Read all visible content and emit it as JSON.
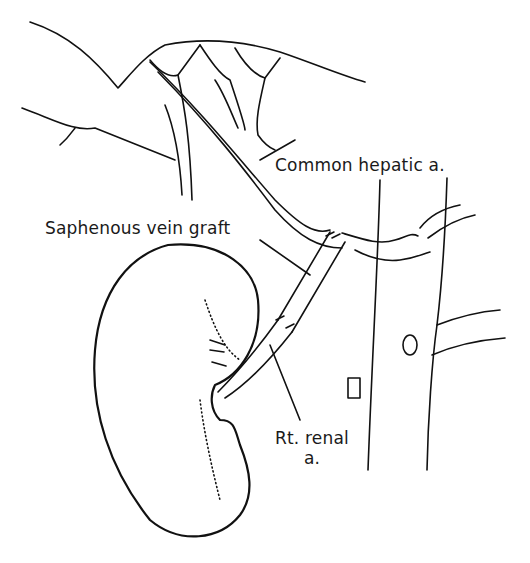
{
  "figure": {
    "type": "anatomical illustration",
    "background": "#ffffff",
    "line_color": "#111111"
  },
  "labels": {
    "common_hepatic": "Common hepatic a.",
    "saphenous_graft": "Saphenous vein graft",
    "renal_line1": "Rt. renal",
    "renal_line2": "a."
  },
  "structures": [
    "liver",
    "hepatic artery branches",
    "common hepatic artery",
    "saphenous vein graft",
    "right kidney",
    "right renal artery",
    "aorta",
    "inferior vena cava"
  ]
}
